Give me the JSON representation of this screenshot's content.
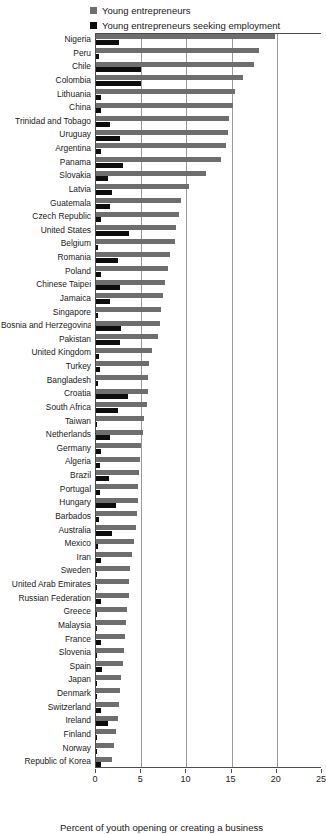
{
  "legend": {
    "position": "top",
    "items": [
      {
        "label": "Young entrepreneurs",
        "color": "#6e6e6e",
        "icon": "square-swatch-icon"
      },
      {
        "label": "Young entrepreneurs seeking employment",
        "color": "#0d0d0d",
        "icon": "square-swatch-icon"
      }
    ]
  },
  "axis": {
    "xlabel": "Percent of youth opening or creating a business",
    "ticks": [
      "0",
      "5",
      "10",
      "15",
      "20",
      "25"
    ]
  },
  "chart_data": {
    "type": "bar",
    "orientation": "horizontal",
    "title": "",
    "subtitle": "",
    "xlabel": "Percent of youth opening or creating a business",
    "ylabel": "",
    "xlim": [
      0,
      25
    ],
    "xticks": [
      0,
      5,
      10,
      15,
      20,
      25
    ],
    "grid": true,
    "legend_position": "top",
    "categories": [
      "Nigeria",
      "Peru",
      "Chile",
      "Colombia",
      "Lithuania",
      "China",
      "Trinidad and Tobago",
      "Uruguay",
      "Argentina",
      "Panama",
      "Slovakia",
      "Latvia",
      "Guatemala",
      "Czech Republic",
      "United States",
      "Belgium",
      "Romania",
      "Poland",
      "Chinese Taipei",
      "Jamaica",
      "Singapore",
      "Bosnia and Herzegovina",
      "Pakistan",
      "United Kingdom",
      "Turkey",
      "Bangladesh",
      "Croatia",
      "South Africa",
      "Taiwan",
      "Netherlands",
      "Germany",
      "Algeria",
      "Brazil",
      "Portugal",
      "Hungary",
      "Barbados",
      "Australia",
      "Mexico",
      "Iran",
      "Sweden",
      "United Arab Emirates",
      "Russian Federation",
      "Greece",
      "Malaysia",
      "France",
      "Slovenia",
      "Spain",
      "Japan",
      "Denmark",
      "Switzerland",
      "Ireland",
      "Finland",
      "Norway",
      "Republic of Korea"
    ],
    "series": [
      {
        "name": "Young entrepreneurs",
        "color": "#6e6e6e",
        "values": [
          19.8,
          18.0,
          17.5,
          16.3,
          15.4,
          15.2,
          14.7,
          14.6,
          14.4,
          13.8,
          12.2,
          10.3,
          9.4,
          9.2,
          8.9,
          8.7,
          8.2,
          8.0,
          7.6,
          7.4,
          7.2,
          7.1,
          6.9,
          6.2,
          5.9,
          5.8,
          5.7,
          5.6,
          5.3,
          5.2,
          5.0,
          4.9,
          4.8,
          4.7,
          4.6,
          4.5,
          4.4,
          4.2,
          4.0,
          3.8,
          3.7,
          3.6,
          3.4,
          3.3,
          3.2,
          3.1,
          3.0,
          2.8,
          2.6,
          2.5,
          2.4,
          2.2,
          2.0,
          1.8
        ]
      },
      {
        "name": "Young entrepreneurs seeking employment",
        "color": "#0d0d0d",
        "values": [
          2.5,
          0.3,
          5.0,
          5.0,
          0.5,
          0.6,
          1.5,
          2.6,
          0.6,
          3.0,
          1.3,
          1.8,
          1.5,
          0.5,
          3.6,
          0.2,
          2.4,
          0.5,
          2.6,
          1.6,
          0.2,
          2.8,
          2.6,
          0.3,
          0.4,
          0.2,
          3.5,
          2.4,
          0.1,
          1.6,
          0.5,
          0.4,
          1.4,
          0.4,
          2.2,
          0.3,
          1.8,
          0.2,
          0.5,
          0.1,
          0.1,
          0.6,
          0.1,
          0.1,
          0.5,
          0.1,
          0.7,
          0.1,
          0.1,
          0.6,
          1.3,
          0.1,
          0.1,
          0.6
        ]
      }
    ]
  }
}
